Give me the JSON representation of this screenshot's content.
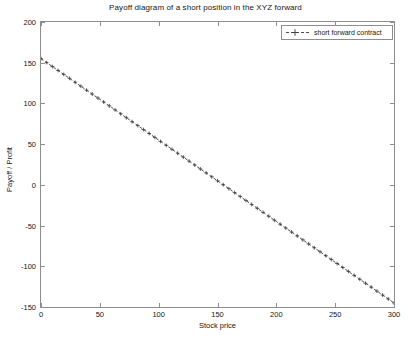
{
  "chart_data": {
    "type": "line",
    "title": "Payoff diagram of a short position in the XYZ forward",
    "xlabel": "Stock price",
    "ylabel": "Payoff / Profit",
    "xlim": [
      0,
      300
    ],
    "ylim": [
      -150,
      200
    ],
    "xticks": [
      0,
      50,
      100,
      150,
      200,
      250,
      300
    ],
    "yticks": [
      200,
      150,
      100,
      50,
      0,
      -50,
      -100,
      -150
    ],
    "grid": false,
    "legend_position": "top-right",
    "series": [
      {
        "name": "short forward contract",
        "marker": "+",
        "linestyle": "dashed",
        "color": "#3a3a3a",
        "x": [
          0,
          10,
          20,
          30,
          40,
          50,
          60,
          70,
          80,
          90,
          100,
          110,
          120,
          130,
          140,
          150,
          160,
          170,
          180,
          190,
          200,
          210,
          220,
          230,
          240,
          250,
          260,
          270,
          280,
          290,
          300
        ],
        "values": [
          155,
          145,
          135,
          125,
          115,
          105,
          95,
          85,
          75,
          65,
          55,
          45,
          35,
          25,
          15,
          5,
          -5,
          -15,
          -25,
          -35,
          -45,
          -55,
          -65,
          -75,
          -85,
          -95,
          -105,
          -115,
          -125,
          -135,
          -145
        ]
      }
    ],
    "annotations": {
      "strike": 155,
      "description": "Payoff = K - S with K = 155"
    }
  },
  "legend": {
    "entries": [
      {
        "label": "short forward contract",
        "marker_glyph": "+"
      }
    ]
  },
  "axes": {
    "x_tick_labels": [
      "0",
      "50",
      "100",
      "150",
      "200",
      "250",
      "300"
    ],
    "y_tick_labels": [
      "200",
      "150",
      "100",
      "50",
      "0",
      "-50",
      "-100",
      "-150"
    ]
  },
  "colors": {
    "background": "#ffffff",
    "axis": "#8d8d8d",
    "text": "#161616",
    "series": "#3a3a3a"
  }
}
